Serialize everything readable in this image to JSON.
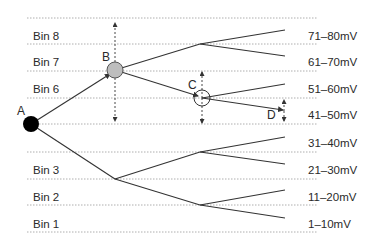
{
  "diagram": {
    "bins": [
      {
        "label": "Bin 8",
        "range": "71–80mV",
        "y": 35
      },
      {
        "label": "Bin 7",
        "range": "61–70mV",
        "y": 61
      },
      {
        "label": "Bin 6",
        "range": "51–60mV",
        "y": 89
      },
      {
        "label": "",
        "range": "41–50mV",
        "y": 115
      },
      {
        "label": "",
        "range": "31–40mV",
        "y": 142
      },
      {
        "label": "Bin 3",
        "range": "21–30mV",
        "y": 168
      },
      {
        "label": "Bin 2",
        "range": "11–20mV",
        "y": 195
      },
      {
        "label": "Bin 1",
        "range": "1–10mV",
        "y": 222
      }
    ],
    "nodes": {
      "A": {
        "label": "A",
        "x": 31,
        "y": 124
      },
      "B": {
        "label": "B",
        "x": 115,
        "y": 70
      },
      "C": {
        "label": "C",
        "x": 202,
        "y": 98
      },
      "D": {
        "label": "D",
        "x": 285,
        "y": 111
      }
    },
    "gridlines_y": [
      18,
      44,
      71,
      98,
      124,
      152,
      179,
      205,
      232
    ],
    "colors": {
      "line": "#333333",
      "grid": "#9a9a9a",
      "node_a": "#000000",
      "node_b_fill": "#bdbdbd",
      "node_c_fill": "#ffffff"
    }
  }
}
